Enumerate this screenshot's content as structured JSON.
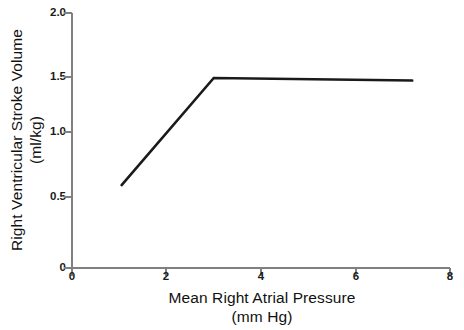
{
  "chart_data": {
    "type": "line",
    "title": "",
    "xlabel": "Mean Right Atrial Pressure",
    "xlabel_units": "(mm Hg)",
    "ylabel": "Right Ventricular Stroke Volume",
    "ylabel_units": "(ml/kg)",
    "xlim": [
      0,
      8
    ],
    "ylim": [
      0,
      2.0
    ],
    "xticks": [
      0,
      2,
      4,
      6,
      8
    ],
    "xtick_labels": [
      "0",
      "2",
      "4",
      "6",
      "8"
    ],
    "yticks": [
      0,
      0.5,
      1.0,
      1.5,
      2.0
    ],
    "ytick_labels": [
      "0",
      "0.5",
      "1.0",
      "1.5",
      "2.0"
    ],
    "grid": false,
    "legend": false,
    "line_color": "#1a1a1a",
    "axis_color": "#808080",
    "series": [
      {
        "name": "Right ventricular function curve",
        "x": [
          1.05,
          3.0,
          7.2
        ],
        "y": [
          0.65,
          1.49,
          1.47
        ]
      }
    ]
  }
}
